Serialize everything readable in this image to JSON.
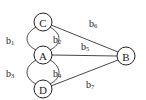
{
  "diagram": {
    "type": "graph",
    "nodes": [
      {
        "id": "C",
        "label": "C",
        "x": 43,
        "y": 22
      },
      {
        "id": "A",
        "label": "A",
        "x": 43,
        "y": 55
      },
      {
        "id": "D",
        "label": "D",
        "x": 43,
        "y": 89
      },
      {
        "id": "B",
        "label": "B",
        "x": 126,
        "y": 56
      }
    ],
    "edges": [
      {
        "id": "b1",
        "base": "b",
        "sub": "1",
        "from": "C",
        "to": "A",
        "shape": "arc-left"
      },
      {
        "id": "b2",
        "base": "b",
        "sub": "2",
        "from": "C",
        "to": "A",
        "shape": "arc-right"
      },
      {
        "id": "b3",
        "base": "b",
        "sub": "3",
        "from": "A",
        "to": "D",
        "shape": "arc-left"
      },
      {
        "id": "b4",
        "base": "b",
        "sub": "4",
        "from": "A",
        "to": "D",
        "shape": "arc-right"
      },
      {
        "id": "b5",
        "base": "b",
        "sub": "5",
        "from": "A",
        "to": "B",
        "shape": "straight"
      },
      {
        "id": "b6",
        "base": "b",
        "sub": "6",
        "from": "C",
        "to": "B",
        "shape": "straight"
      },
      {
        "id": "b7",
        "base": "b",
        "sub": "7",
        "from": "D",
        "to": "B",
        "shape": "straight"
      }
    ]
  }
}
